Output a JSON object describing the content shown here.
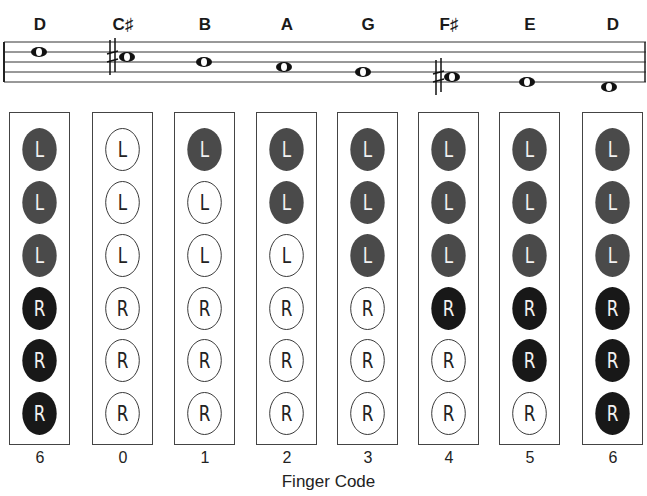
{
  "diagram": {
    "title": "Finger Code",
    "columns": [
      {
        "note": "D",
        "code": "6",
        "holes": [
          "closed",
          "closed",
          "closed",
          "closed",
          "closed",
          "closed"
        ]
      },
      {
        "note": "C♯",
        "code": "0",
        "holes": [
          "open",
          "open",
          "open",
          "open",
          "open",
          "open"
        ]
      },
      {
        "note": "B",
        "code": "1",
        "holes": [
          "closed",
          "open",
          "open",
          "open",
          "open",
          "open"
        ]
      },
      {
        "note": "A",
        "code": "2",
        "holes": [
          "closed",
          "closed",
          "open",
          "open",
          "open",
          "open"
        ]
      },
      {
        "note": "G",
        "code": "3",
        "holes": [
          "closed",
          "closed",
          "closed",
          "open",
          "open",
          "open"
        ]
      },
      {
        "note": "F♯",
        "code": "4",
        "holes": [
          "closed",
          "closed",
          "closed",
          "closed",
          "open",
          "open"
        ]
      },
      {
        "note": "E",
        "code": "5",
        "holes": [
          "closed",
          "closed",
          "closed",
          "closed",
          "closed",
          "open"
        ]
      },
      {
        "note": "D",
        "code": "6",
        "holes": [
          "closed",
          "closed",
          "closed",
          "closed",
          "closed",
          "closed"
        ]
      }
    ],
    "hole_labels": [
      "L",
      "L",
      "L",
      "R",
      "R",
      "R"
    ],
    "colors": {
      "left_closed": "#4a4a4a",
      "right_closed": "#181818",
      "open": "#ffffff"
    }
  }
}
